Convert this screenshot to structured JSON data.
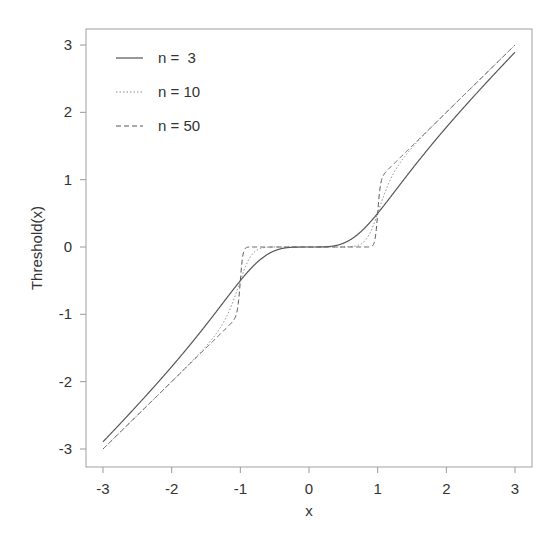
{
  "chart_data": {
    "type": "line",
    "title": "",
    "xlabel": "x",
    "ylabel": "Threshold(x)",
    "xlim": [
      -3.2,
      3.2
    ],
    "ylim": [
      -3.2,
      3.2
    ],
    "xticks": [
      -3,
      -2,
      -1,
      0,
      1,
      2,
      3
    ],
    "yticks": [
      -3,
      -2,
      -1,
      0,
      1,
      2,
      3
    ],
    "xtick_labels": [
      "-3",
      "-2",
      "-1",
      "0",
      "1",
      "2",
      "3"
    ],
    "ytick_labels": [
      "-3",
      "-2",
      "-1",
      "0",
      "1",
      "2",
      "3"
    ],
    "grid": false,
    "legend_position": "top-left",
    "function": "x * |x|^n / (1 + |x|^n)",
    "series": [
      {
        "name": "n =  3",
        "n": 3,
        "line_style": "solid",
        "x": [
          -3,
          -2,
          -1.5,
          -1,
          -0.5,
          0,
          0.5,
          1,
          1.5,
          2,
          3
        ],
        "y": [
          -2.893,
          -1.778,
          -1.157,
          -0.5,
          -0.056,
          0,
          0.056,
          0.5,
          1.157,
          1.778,
          2.893
        ]
      },
      {
        "name": "n = 10",
        "n": 10,
        "line_style": "dotted",
        "x": [
          -3,
          -2,
          -1.5,
          -1,
          -0.5,
          0,
          0.5,
          1,
          1.5,
          2,
          3
        ],
        "y": [
          -3.0,
          -1.998,
          -1.474,
          -0.5,
          -0.0005,
          0,
          0.0005,
          0.5,
          1.474,
          1.998,
          3.0
        ]
      },
      {
        "name": "n = 50",
        "n": 50,
        "line_style": "dashed",
        "x": [
          -3,
          -2,
          -1.5,
          -1,
          -0.5,
          0,
          0.5,
          1,
          1.5,
          2,
          3
        ],
        "y": [
          -3.0,
          -2.0,
          -1.5,
          -0.5,
          0,
          0,
          0,
          0.5,
          1.5,
          2.0,
          3.0
        ]
      }
    ]
  },
  "legend": {
    "items": [
      {
        "label": "n =  3"
      },
      {
        "label": "n = 10"
      },
      {
        "label": "n = 50"
      }
    ]
  },
  "axes": {
    "xlabel": "x",
    "ylabel": "Threshold(x)",
    "line_color": "#9a9a9a",
    "curve_color": "#555555"
  }
}
